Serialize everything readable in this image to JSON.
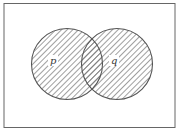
{
  "diagram": {
    "type": "venn",
    "universe": {
      "label": ""
    },
    "sets": [
      {
        "name": "p",
        "label": "p"
      },
      {
        "name": "q",
        "label": "q"
      }
    ],
    "shaded_region": "p ∪ q",
    "colors": {
      "stroke": "#555555",
      "hatch": "#666666",
      "background": "#ffffff"
    }
  }
}
